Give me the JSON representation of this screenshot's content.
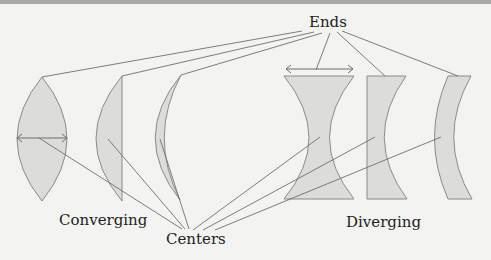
{
  "labels": {
    "ends": "Ends",
    "centers": "Centers",
    "converging": "Converging",
    "diverging": "Diverging"
  },
  "lenses": {
    "converging": [
      "biconvex",
      "plano-convex",
      "convex-meniscus"
    ],
    "diverging": [
      "biconcave",
      "plano-concave",
      "concave-meniscus"
    ]
  },
  "colors": {
    "background": "#f3f3f1",
    "lens_fill": "#dcdcda",
    "lens_stroke": "#8a8a88",
    "line": "#6e6e6c",
    "text": "#222222"
  }
}
